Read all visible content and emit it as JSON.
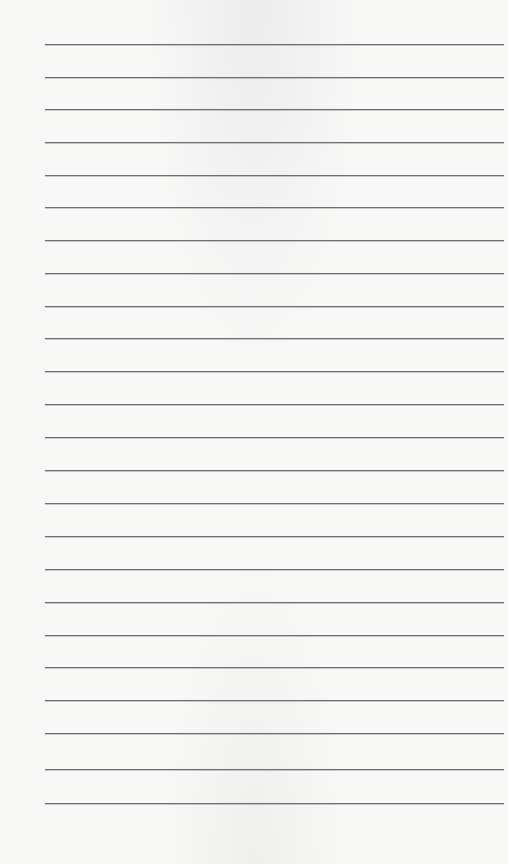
{
  "page": {
    "type": "lined-notepad",
    "background_color": "#f8f8f7",
    "line_color": "#6f6f6f",
    "line_left_px": 45,
    "line_right_px": 504,
    "lines_y": [
      44,
      77,
      109,
      142,
      175,
      207,
      240,
      273,
      306,
      338,
      371,
      404,
      437,
      470,
      503,
      536,
      569,
      602,
      635,
      667,
      700,
      733,
      769,
      803
    ]
  }
}
